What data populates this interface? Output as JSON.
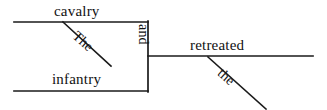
{
  "diagram": {
    "type": "reed-kellogg-sentence-diagram",
    "sentence": "The cavalry and the infantry retreated.",
    "ink_color": "#1a1a1a",
    "background_color": "#ffffff",
    "words": {
      "subject_one": "cavalry",
      "subject_two": "infantry",
      "conjunction": "and",
      "verb": "retreated",
      "article_upper": "The",
      "article_lower": "the"
    },
    "lines": [
      {
        "name": "upper-subject-baseline",
        "role": "baseline for first compound subject",
        "x1": 14,
        "y1": 22,
        "x2": 148,
        "y2": 22
      },
      {
        "name": "lower-subject-baseline",
        "role": "baseline for second compound subject",
        "x1": 14,
        "y1": 91,
        "x2": 148,
        "y2": 91
      },
      {
        "name": "conjunction-connector",
        "role": "vertical dashed-style connector carrying the conjunction",
        "x1": 148,
        "y1": 22,
        "x2": 148,
        "y2": 91
      },
      {
        "name": "main-baseline",
        "role": "predicate baseline",
        "x1": 148,
        "y1": 56,
        "x2": 313,
        "y2": 56
      },
      {
        "name": "article-upper-slant",
        "role": "modifier line for the article on cavalry",
        "x1": 63,
        "y1": 22,
        "x2": 111,
        "y2": 66
      },
      {
        "name": "article-lower-slant",
        "role": "modifier line for the article on infantry",
        "x1": 208,
        "y1": 57,
        "x2": 266,
        "y2": 109
      }
    ]
  }
}
